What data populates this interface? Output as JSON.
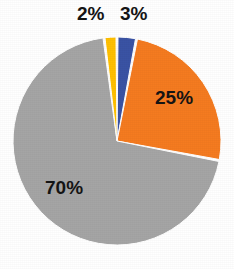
{
  "chart_data": {
    "type": "pie",
    "title": "",
    "subtitle": "",
    "xlabel": "",
    "ylabel": "",
    "grid": false,
    "legend": "none",
    "start_angle_deg": 0,
    "direction": "clockwise",
    "background": "#ffffff",
    "separator_color": "#ffffff",
    "label_color": "#151515",
    "categories": [
      "Blue",
      "Orange",
      "Gray",
      "Yellow"
    ],
    "values": [
      3,
      25,
      70,
      2
    ],
    "slices": [
      {
        "name": "slice-blue",
        "label": "3%",
        "value": 3,
        "color": "#3A53A4",
        "label_position": "outside"
      },
      {
        "name": "slice-orange",
        "label": "25%",
        "value": 25,
        "color": "#F57B20",
        "label_position": "inside"
      },
      {
        "name": "slice-gray",
        "label": "70%",
        "value": 70,
        "color": "#A5A5A5",
        "label_position": "inside"
      },
      {
        "name": "slice-yellow",
        "label": "2%",
        "value": 2,
        "color": "#FFC000",
        "label_position": "outside"
      }
    ]
  },
  "geometry": {
    "center_x": 117,
    "center_y": 141,
    "radius": 104
  }
}
